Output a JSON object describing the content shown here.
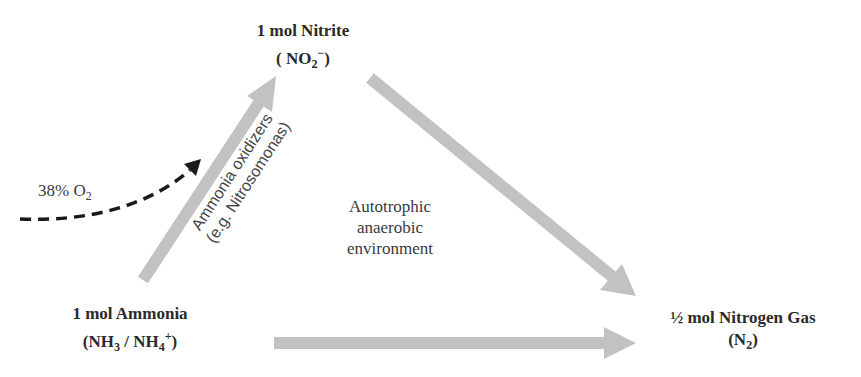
{
  "nodes": {
    "nitrite": {
      "title": "1 mol Nitrite",
      "formula_pre": "( NO",
      "formula_sub": "2",
      "formula_sup": "−",
      "formula_post": ")"
    },
    "ammonia": {
      "title": "1 mol Ammonia",
      "formula_a": "(NH",
      "formula_a_sub": "3",
      "formula_mid": " / NH",
      "formula_b_sub": "4",
      "formula_b_sup": "+",
      "formula_post": ")"
    },
    "nitrogen": {
      "title": "½ mol Nitrogen Gas",
      "formula_pre": "(N",
      "formula_sub": "2",
      "formula_post": ")"
    }
  },
  "labels": {
    "oxygen": {
      "text": "38% O",
      "sub": "2"
    },
    "oxidizers_line1": "Ammonia oxidizers",
    "oxidizers_line2": "(e.g. Nitrosomonas)",
    "environment_line1": "Autotrophic",
    "environment_line2": "anaerobic",
    "environment_line3": "environment"
  },
  "colors": {
    "arrow_fill": "#c2c2c2",
    "dashed_arrow": "#1a1a1a",
    "text_dark": "#2a2a2a"
  }
}
